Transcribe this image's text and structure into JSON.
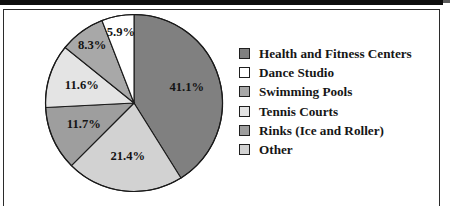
{
  "figure": {
    "frame_color": "#2b2b2b",
    "page_edge_color": "#0d0d0d",
    "background": "#ffffff"
  },
  "chart_data": {
    "type": "pie",
    "title": "",
    "subtitle": "",
    "xlabel": "",
    "ylabel": "",
    "legend_position": "right",
    "grid": false,
    "start_angle_deg": 0,
    "direction": "clockwise",
    "units": "percent",
    "categories": [
      "Health and Fitness Centers",
      "Dance Studio",
      "Swimming Pools",
      "Tennis Courts",
      "Rinks (Ice and Roller)",
      "Other"
    ],
    "values": [
      41.1,
      5.9,
      8.3,
      11.6,
      11.7,
      21.4
    ],
    "colors": [
      "#808080",
      "#ffffff",
      "#a8a8a8",
      "#e4e4e4",
      "#9e9e9e",
      "#d2d2d2"
    ],
    "slices": [
      {
        "label": "41.1%",
        "value": 41.1,
        "category": "Health and Fitness Centers",
        "color": "#808080"
      },
      {
        "label": "21.4%",
        "value": 21.4,
        "category": "Other",
        "color": "#d2d2d2"
      },
      {
        "label": "11.7%",
        "value": 11.7,
        "category": "Rinks (Ice and Roller)",
        "color": "#9e9e9e"
      },
      {
        "label": "11.6%",
        "value": 11.6,
        "category": "Tennis Courts",
        "color": "#e4e4e4"
      },
      {
        "label": "8.3%",
        "value": 8.3,
        "category": "Swimming Pools",
        "color": "#a8a8a8"
      },
      {
        "label": "5.9%",
        "value": 5.9,
        "category": "Dance Studio",
        "color": "#ffffff"
      }
    ]
  },
  "legend": {
    "items": [
      {
        "label": "Health and Fitness Centers",
        "color": "#808080"
      },
      {
        "label": "Dance Studio",
        "color": "#ffffff"
      },
      {
        "label": "Swimming Pools",
        "color": "#a8a8a8"
      },
      {
        "label": "Tennis Courts",
        "color": "#e4e4e4"
      },
      {
        "label": "Rinks (Ice and Roller)",
        "color": "#9e9e9e"
      },
      {
        "label": "Other",
        "color": "#d2d2d2"
      }
    ]
  }
}
